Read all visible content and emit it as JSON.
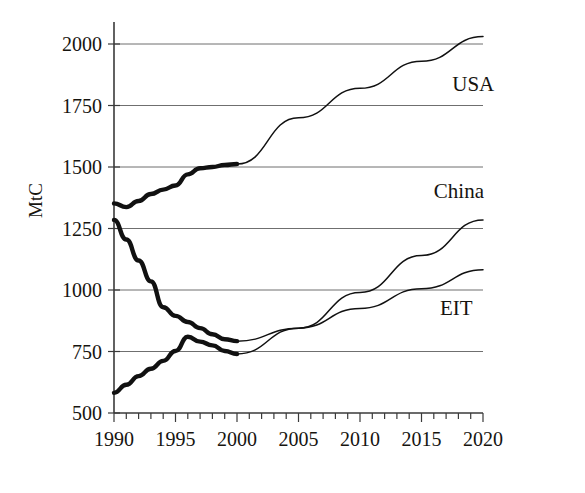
{
  "chart_data": {
    "type": "line",
    "title": "",
    "subtitle": "",
    "xlabel": "",
    "ylabel": "MtC",
    "xlim": [
      1990,
      2020
    ],
    "ylim": [
      500,
      2100
    ],
    "grid": true,
    "grid_axis": "y",
    "legend_position": "right-inline",
    "y_ticks": [
      500,
      750,
      1000,
      1250,
      1500,
      1750,
      2000
    ],
    "x_ticks": [
      1990,
      1995,
      2000,
      2005,
      2010,
      2015,
      2020
    ],
    "x_minor_tick_step": 1,
    "annotations": [
      {
        "text": "USA",
        "x": 2017.5,
        "y": 1810
      },
      {
        "text": "China",
        "x": 2016.0,
        "y": 1375
      },
      {
        "text": "EIT",
        "x": 2016.5,
        "y": 900
      }
    ],
    "series": [
      {
        "name": "USA",
        "label": "USA",
        "color": "#111111",
        "history_years": [
          1990,
          1991,
          1992,
          1993,
          1994,
          1995,
          1996,
          1997,
          1998,
          1999,
          2000
        ],
        "history_values": [
          1352,
          1337,
          1362,
          1390,
          1408,
          1425,
          1470,
          1495,
          1500,
          1508,
          1512
        ],
        "projection_years": [
          2000,
          2005,
          2010,
          2015,
          2020
        ],
        "projection_values": [
          1512,
          1700,
          1820,
          1930,
          2030
        ]
      },
      {
        "name": "China",
        "label": "China",
        "color": "#111111",
        "history_years": [
          1990,
          1991,
          1992,
          1993,
          1994,
          1995,
          1996,
          1997,
          1998,
          1999,
          2000
        ],
        "history_values": [
          582,
          615,
          650,
          680,
          712,
          752,
          810,
          790,
          775,
          752,
          740
        ],
        "projection_years": [
          2000,
          2005,
          2010,
          2015,
          2020
        ],
        "projection_values": [
          740,
          845,
          990,
          1140,
          1285
        ]
      },
      {
        "name": "EIT",
        "label": "EIT",
        "color": "#111111",
        "history_years": [
          1990,
          1991,
          1992,
          1993,
          1994,
          1995,
          1996,
          1997,
          1998,
          1999,
          2000
        ],
        "history_values": [
          1285,
          1205,
          1120,
          1035,
          930,
          895,
          870,
          845,
          820,
          800,
          792
        ],
        "projection_years": [
          2000,
          2005,
          2010,
          2015,
          2020
        ],
        "projection_values": [
          792,
          845,
          925,
          1005,
          1082
        ]
      }
    ]
  }
}
